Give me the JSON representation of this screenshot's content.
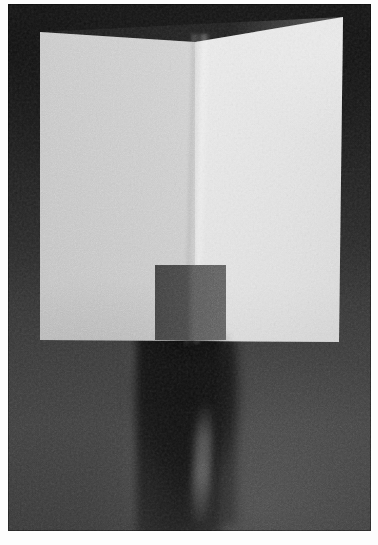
{
  "image": {
    "kind": "photograph",
    "title": "Folded white sheet of paper standing on a dark surface",
    "description": "Black and white grainy photograph of a large sheet of paper folded vertically down the middle, standing upright against a dark background, with a small dark rectangular block in front of the fold and a blurred dark figure behind/below.",
    "orientation": "portrait",
    "width_px": 378,
    "height_px": 545,
    "page_margin_px": 8
  },
  "palette": {
    "page_white": "#fdfdfd",
    "backdrop_dark": "#2b2b2b",
    "backdrop_light": "#3a3a3a",
    "paper_left_panel": "#cfcfcf",
    "paper_right_panel": "#ebebeb",
    "block_left": "#3f3f3f",
    "block_right": "#5a5a5a",
    "figure_shadow": "#0d0d0d"
  },
  "elements": [
    {
      "name": "backdrop",
      "label": "Dark studio backdrop",
      "tone": "dark gray, heavy film grain"
    },
    {
      "name": "paper-left-panel",
      "label": "Left panel of folded sheet",
      "tone": "light gray, in shade",
      "bounds": {
        "x": 32,
        "y": 28,
        "w": 155,
        "h": 309
      }
    },
    {
      "name": "paper-right-panel",
      "label": "Right panel of folded sheet",
      "tone": "bright white, lit",
      "bounds": {
        "x": 187,
        "y": 13,
        "w": 148,
        "h": 325
      }
    },
    {
      "name": "fold-crease",
      "label": "Vertical centre fold",
      "tone": "soft highlight seam",
      "x_position": 187
    },
    {
      "name": "block-object",
      "label": "Small dark rectangular block",
      "tone": "dark gray, two-tone faces",
      "bounds": {
        "x": 147,
        "y": 261,
        "w": 71,
        "h": 75
      }
    },
    {
      "name": "figure-silhouette",
      "label": "Blurred dark figure below the sheet",
      "tone": "near black, motion blurred",
      "bounds": {
        "x": 118,
        "y": 318,
        "w": 110,
        "h": 212
      }
    }
  ],
  "grain": {
    "label": "Film grain overlay",
    "intensity": "high",
    "opacity": 0.42
  }
}
